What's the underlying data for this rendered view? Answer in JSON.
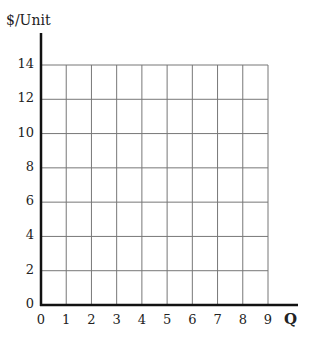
{
  "chart_data": {
    "type": "line",
    "title": "",
    "xlabel": "Q",
    "ylabel": "$/Unit",
    "x_ticks": [
      "0",
      "1",
      "2",
      "3",
      "4",
      "5",
      "6",
      "7",
      "8",
      "9"
    ],
    "y_ticks": [
      "0",
      "2",
      "4",
      "6",
      "8",
      "10",
      "12",
      "14"
    ],
    "xlim": [
      0,
      9
    ],
    "ylim": [
      0,
      14
    ],
    "grid": true,
    "series": [],
    "note": "Blank grid with no plotted data"
  }
}
